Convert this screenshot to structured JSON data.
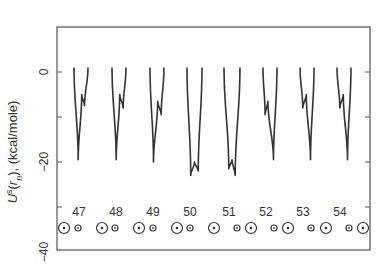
{
  "chart_data": {
    "type": "line",
    "title": "",
    "xlabel": "",
    "ylabel": "U^s(r_n), (kcal/mole)",
    "ylabel_parts": {
      "main": "U",
      "sup": "s",
      "open": "(",
      "var": "r",
      "sub": "n",
      "close": "), (kcal/mole)"
    },
    "ylim": [
      -40,
      10
    ],
    "yticks": [
      0,
      -20,
      -40
    ],
    "ytick_labels": [
      "0",
      "−20",
      "−40"
    ],
    "minor_yticks": [
      -10,
      -30
    ],
    "grid": false,
    "legend": null,
    "residue_labels": [
      "47",
      "48",
      "49",
      "50",
      "51",
      "52",
      "53",
      "54"
    ],
    "series": [
      {
        "name": "47",
        "points": [
          [
            0,
            1
          ],
          [
            0.3,
            -19.5
          ],
          [
            0.55,
            -5
          ],
          [
            0.75,
            -7.5
          ],
          [
            1,
            1
          ]
        ]
      },
      {
        "name": "48",
        "points": [
          [
            0,
            1
          ],
          [
            0.3,
            -19.5
          ],
          [
            0.55,
            -5
          ],
          [
            0.8,
            -8
          ],
          [
            1,
            1
          ]
        ]
      },
      {
        "name": "49",
        "points": [
          [
            0,
            1
          ],
          [
            0.25,
            -20
          ],
          [
            0.55,
            -6.5
          ],
          [
            0.8,
            -9.5
          ],
          [
            1,
            1
          ]
        ]
      },
      {
        "name": "50",
        "points": [
          [
            0,
            1
          ],
          [
            0.25,
            -23
          ],
          [
            0.5,
            -20
          ],
          [
            0.75,
            -22
          ],
          [
            1,
            1
          ]
        ]
      },
      {
        "name": "51",
        "points": [
          [
            0,
            1
          ],
          [
            0.3,
            -21.5
          ],
          [
            0.5,
            -19.5
          ],
          [
            0.7,
            -23
          ],
          [
            1,
            1
          ]
        ]
      },
      {
        "name": "52",
        "points": [
          [
            0,
            1
          ],
          [
            0.15,
            -9.5
          ],
          [
            0.35,
            -6.5
          ],
          [
            0.75,
            -19.5
          ],
          [
            1,
            1
          ]
        ]
      },
      {
        "name": "53",
        "points": [
          [
            0,
            1
          ],
          [
            0.2,
            -8
          ],
          [
            0.45,
            -5
          ],
          [
            0.75,
            -19.5
          ],
          [
            1,
            1
          ]
        ]
      },
      {
        "name": "54",
        "points": [
          [
            0,
            1
          ],
          [
            0.2,
            -8
          ],
          [
            0.45,
            -5
          ],
          [
            0.75,
            -19.5
          ],
          [
            1,
            1
          ]
        ]
      }
    ],
    "annotations": "Row of atom symbols (large circled dots and small circled dots) below each residue label"
  }
}
